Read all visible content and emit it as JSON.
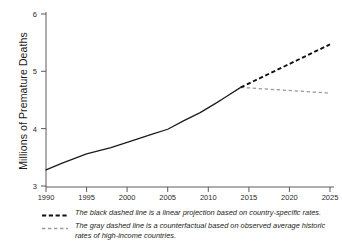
{
  "chart_data": {
    "type": "line",
    "title": "",
    "xlabel": "",
    "ylabel": "Millions of Premature Deaths",
    "xlim": [
      1990,
      2026
    ],
    "ylim": [
      2.85,
      6.15
    ],
    "xticks": [
      1990,
      1995,
      2000,
      2005,
      2010,
      2015,
      2020,
      2025
    ],
    "yticks": [
      3,
      4,
      5,
      6
    ],
    "grid": false,
    "legend_position": "below-plot",
    "series": [
      {
        "name": "observed",
        "style": "solid-black",
        "x": [
          1990,
          1992,
          1995,
          1998,
          2000,
          2003,
          2005,
          2007,
          2009,
          2011,
          2012,
          2014
        ],
        "values": [
          3.28,
          3.4,
          3.56,
          3.67,
          3.76,
          3.9,
          3.99,
          4.14,
          4.28,
          4.45,
          4.54,
          4.72
        ]
      },
      {
        "name": "linear projection based on country-specific rates",
        "style": "dashed-black",
        "x": [
          2014,
          2025
        ],
        "values": [
          4.72,
          5.47
        ]
      },
      {
        "name": "counterfactual based on observed average historic rates of high-income countries",
        "style": "dashed-gray",
        "x": [
          2014,
          2025
        ],
        "values": [
          4.72,
          4.62
        ]
      }
    ]
  },
  "axis": {
    "y_label": "Millions of Premature Deaths",
    "y_tick_labels": [
      "6",
      "5",
      "4",
      "3"
    ],
    "x_tick_labels": [
      "1990",
      "1995",
      "2000",
      "2005",
      "2010",
      "2015",
      "2020",
      "2025"
    ]
  },
  "legend": {
    "entries": [
      {
        "key": "black-dashed-line-swatch",
        "text": "The black dashed line is a linear projection based on country-specific rates."
      },
      {
        "key": "gray-dashed-line-swatch",
        "text": "The gray dashed line is a counterfactual based on observed average historic rates of high-income countries."
      }
    ]
  },
  "colors": {
    "solid_line": "#1b1b1b",
    "black_dashed": "#111111",
    "gray_dashed": "#9a9a9a",
    "axis": "#4a4a4a",
    "background": "#ffffff"
  }
}
